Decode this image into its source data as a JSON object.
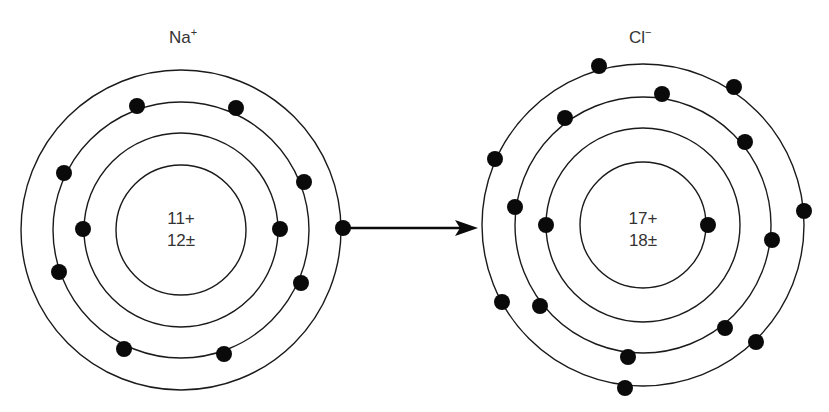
{
  "diagram": {
    "colors": {
      "line": "#1a1a1a",
      "electron": "#0a0a0a",
      "text": "#333333",
      "background": "#ffffff"
    },
    "na": {
      "symbol": "Na",
      "charge_sign": "+",
      "nucleus_protons": "11+",
      "nucleus_neutrons": "12±",
      "center": [
        181,
        230
      ],
      "shell_radii": [
        65,
        97,
        128,
        160
      ],
      "electrons": [
        [
          83,
          229
        ],
        [
          280,
          229
        ],
        [
          137,
          106
        ],
        [
          236,
          108
        ],
        [
          64,
          173
        ],
        [
          304,
          182
        ],
        [
          59,
          272
        ],
        [
          301,
          283
        ],
        [
          124,
          349
        ],
        [
          224,
          354
        ],
        [
          343,
          228
        ]
      ]
    },
    "cl": {
      "symbol": "Cl",
      "charge_sign": "−",
      "nucleus_protons": "17+",
      "nucleus_neutrons": "18±",
      "center": [
        643,
        225
      ],
      "shell_radii": [
        63,
        97,
        128,
        161
      ],
      "electrons": [
        [
          546,
          225
        ],
        [
          708,
          225
        ],
        [
          662,
          94
        ],
        [
          565,
          118
        ],
        [
          745,
          142
        ],
        [
          515,
          207
        ],
        [
          772,
          240
        ],
        [
          540,
          306
        ],
        [
          725,
          328
        ],
        [
          628,
          357
        ],
        [
          599,
          66
        ],
        [
          734,
          87
        ],
        [
          495,
          159
        ],
        [
          804,
          211
        ],
        [
          502,
          302
        ],
        [
          756,
          342
        ],
        [
          625,
          388
        ]
      ]
    },
    "arrow": {
      "from": [
        343,
        228
      ],
      "to": [
        478,
        228
      ],
      "meaning": "electron transfer"
    }
  }
}
